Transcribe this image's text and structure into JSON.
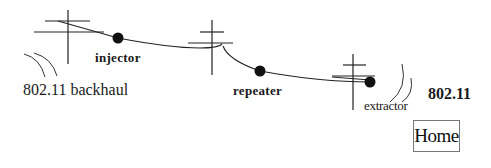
{
  "diagram": {
    "type": "network-topology",
    "labels": {
      "backhaul": "802.11 backhaul",
      "injector": "injector",
      "repeater": "repeater",
      "extractor": "extractor",
      "wifi": "802.11"
    },
    "nodes": [
      {
        "id": "injector",
        "label": "injector"
      },
      {
        "id": "repeater",
        "label": "repeater"
      },
      {
        "id": "extractor",
        "label": "extractor"
      }
    ],
    "poles": [
      {
        "id": "pole-1"
      },
      {
        "id": "pole-2"
      },
      {
        "id": "pole-3"
      }
    ],
    "wireless_links": [
      {
        "id": "backhaul-link",
        "label": "802.11 backhaul"
      },
      {
        "id": "access-link",
        "label": "802.11"
      }
    ]
  },
  "navigation": {
    "home_label": "Home"
  },
  "colors": {
    "line": "#222222",
    "node": "#111111",
    "background": "#ffffff"
  }
}
